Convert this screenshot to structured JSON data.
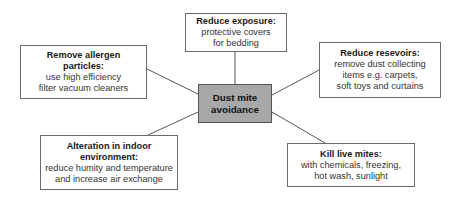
{
  "diagram": {
    "center": {
      "label_line1": "Dust mite",
      "label_line2": "avoidance",
      "fill": "#a8a8a8"
    },
    "nodes": [
      {
        "id": "reduce-exposure",
        "title": "Reduce exposure:",
        "body_lines": [
          "protective covers",
          "for bedding"
        ]
      },
      {
        "id": "remove-allergen",
        "title_lines": [
          "Remove allergen",
          "particles:"
        ],
        "body_lines": [
          "use high efficiency",
          "filter vacuum cleaners"
        ]
      },
      {
        "id": "reduce-resevoirs",
        "title": "Reduce resevoirs:",
        "body_lines": [
          "remove dust collecting",
          "items e.g. carpets,",
          "soft toys and curtains"
        ]
      },
      {
        "id": "alteration-indoor",
        "title_lines": [
          "Alteration in indoor",
          "environment:"
        ],
        "body_lines": [
          "reduce humity and temperature",
          "and increase air exchange"
        ]
      },
      {
        "id": "kill-live-mites",
        "title": "Kill live mites:",
        "body_lines": [
          "with chemicals, freezing,",
          "hot wash, sunlight"
        ]
      }
    ],
    "edges": [
      {
        "from": "center",
        "to": "reduce-exposure"
      },
      {
        "from": "center",
        "to": "remove-allergen"
      },
      {
        "from": "center",
        "to": "reduce-resevoirs"
      },
      {
        "from": "center",
        "to": "alteration-indoor"
      },
      {
        "from": "center",
        "to": "kill-live-mites"
      }
    ],
    "line_color": "#555555"
  }
}
